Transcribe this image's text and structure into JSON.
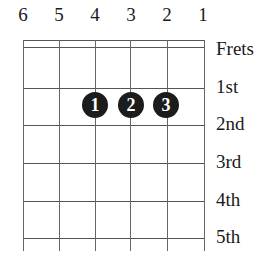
{
  "diagram": {
    "strings": [
      "6",
      "5",
      "4",
      "3",
      "2",
      "1"
    ],
    "header_label": "Frets",
    "fret_labels": [
      "1st",
      "2nd",
      "3rd",
      "4th",
      "5th"
    ],
    "fingers": [
      {
        "finger": "1",
        "string": "4",
        "fret": "2"
      },
      {
        "finger": "2",
        "string": "3",
        "fret": "2"
      },
      {
        "finger": "3",
        "string": "2",
        "fret": "2"
      }
    ]
  }
}
